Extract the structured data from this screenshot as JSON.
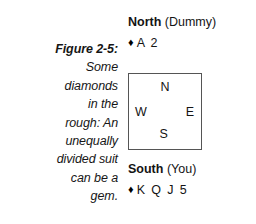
{
  "figure": {
    "label": "Figure 2-5:",
    "caption_lines": [
      "Some",
      "diamonds",
      "in the",
      "rough: An",
      "unequally",
      "divided suit",
      "can be a",
      "gem."
    ]
  },
  "hands": {
    "north": {
      "seat": "North",
      "role": "(Dummy)",
      "suit_symbol": "♦",
      "suit_icon_name": "diamond-suit-icon",
      "cards": "A 2"
    },
    "south": {
      "seat": "South",
      "role": "(You)",
      "suit_symbol": "♦",
      "suit_icon_name": "diamond-suit-icon",
      "cards": "K Q J 5"
    }
  },
  "compass": {
    "north": "N",
    "west": "W",
    "east": "E",
    "south": "S"
  },
  "colors": {
    "background": "#ffffff",
    "text": "#141414",
    "box_border": "#555555",
    "suit_symbol": "#000000"
  }
}
